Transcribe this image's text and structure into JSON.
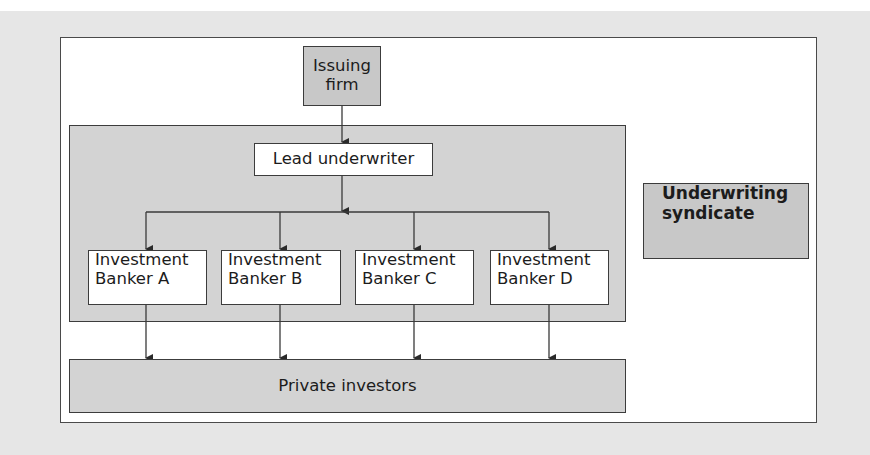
{
  "diagram": {
    "type": "flowchart",
    "nodes": {
      "issuing_firm": {
        "label_line1": "Issuing",
        "label_line2": "firm"
      },
      "lead_underwriter": {
        "label": "Lead underwriter"
      },
      "bankers": [
        {
          "line1": "Investment",
          "line2": "Banker A"
        },
        {
          "line1": "Investment",
          "line2": "Banker B"
        },
        {
          "line1": "Investment",
          "line2": "Banker C"
        },
        {
          "line1": "Investment",
          "line2": "Banker D"
        }
      ],
      "private_investors": {
        "label": "Private investors"
      }
    },
    "legend": {
      "label_line1": "Underwriting",
      "label_line2": "syndicate"
    },
    "edges": [
      {
        "from": "Issuing firm",
        "to": "Lead underwriter"
      },
      {
        "from": "Lead underwriter",
        "to": "Investment Banker A"
      },
      {
        "from": "Lead underwriter",
        "to": "Investment Banker B"
      },
      {
        "from": "Lead underwriter",
        "to": "Investment Banker C"
      },
      {
        "from": "Lead underwriter",
        "to": "Investment Banker D"
      },
      {
        "from": "Investment Banker A",
        "to": "Private investors"
      },
      {
        "from": "Investment Banker B",
        "to": "Private investors"
      },
      {
        "from": "Investment Banker C",
        "to": "Private investors"
      },
      {
        "from": "Investment Banker D",
        "to": "Private investors"
      }
    ],
    "colors": {
      "page_background": "#e6e6e6",
      "frame_background": "#ffffff",
      "syndicate_fill": "#d3d3d3",
      "dark_box_fill": "#c8c8c8",
      "line_color": "#3c3c3c"
    }
  }
}
